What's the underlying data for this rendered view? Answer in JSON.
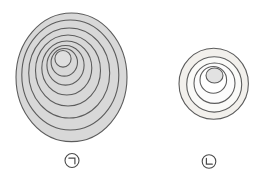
{
  "diagram": {
    "kind": "tree-growth-rings-comparison",
    "background_color": "#ffffff",
    "ring_stroke_color": "#5c5c5c"
  },
  "figures": [
    {
      "id": "a",
      "name": "large-ring-set",
      "stroke": "#5c5c5c",
      "stroke_width": 1.1,
      "rings": [
        {
          "cx": 71.5,
          "cy": 77.3,
          "rx": 55.5,
          "ry": 64.3,
          "fill": "#d8d8d8"
        },
        {
          "cx": 70.3,
          "cy": 75.0,
          "rx": 48.5,
          "ry": 55.0,
          "fill": "#d8d8d8"
        },
        {
          "cx": 69.2,
          "cy": 73.0,
          "rx": 40.5,
          "ry": 45.0,
          "fill": "#d8d8d8"
        },
        {
          "cx": 68.0,
          "cy": 70.5,
          "rx": 32.5,
          "ry": 35.5,
          "fill": "#d8d8d8"
        },
        {
          "cx": 66.8,
          "cy": 68.0,
          "rx": 25.0,
          "ry": 27.0,
          "fill": "#d8d8d8"
        },
        {
          "cx": 65.5,
          "cy": 65.3,
          "rx": 18.6,
          "ry": 19.8,
          "fill": "#d8d8d8"
        },
        {
          "cx": 64.3,
          "cy": 62.3,
          "rx": 13.2,
          "ry": 13.8,
          "fill": "#d8d8d8"
        },
        {
          "cx": 63.0,
          "cy": 58.8,
          "rx": 8.1,
          "ry": 8.3,
          "fill": "#dfdfdf"
        }
      ]
    },
    {
      "id": "b",
      "name": "small-ring-set",
      "stroke": "#5c5c5c",
      "stroke_width": 1.1,
      "rings": [
        {
          "cx": 213.7,
          "cy": 83.8,
          "rx": 34.7,
          "ry": 35.5,
          "fill": "#f2f0ec"
        },
        {
          "cx": 214.2,
          "cy": 84.4,
          "rx": 27.5,
          "ry": 27.7,
          "fill": "#fafaf8"
        },
        {
          "cx": 214.5,
          "cy": 83.2,
          "rx": 20.5,
          "ry": 20.2,
          "fill": "#fcfcfc"
        },
        {
          "cx": 213.3,
          "cy": 79.9,
          "rx": 13.3,
          "ry": 13.4,
          "fill": "#ffffff"
        },
        {
          "cx": 214.5,
          "cy": 75.5,
          "rx": 8.5,
          "ry": 7.5,
          "fill": "#e2e2e2"
        }
      ]
    }
  ],
  "labels": [
    {
      "id": "a",
      "char": "ㄱ",
      "glyph": "circled-hangul-giyeok",
      "cx": 72,
      "cy": 160.5,
      "r": 7.0
    },
    {
      "id": "b",
      "char": "ㄴ",
      "glyph": "circled-hangul-nieun",
      "cx": 209,
      "cy": 161.5,
      "r": 6.8
    }
  ]
}
